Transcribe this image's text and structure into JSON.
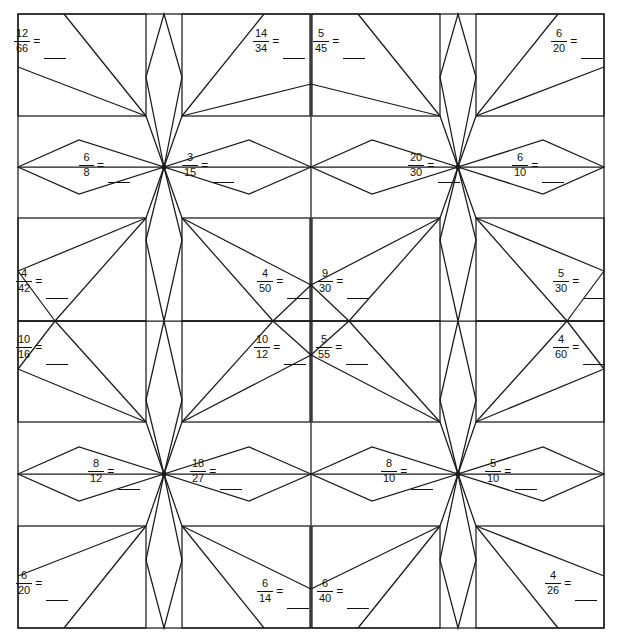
{
  "page": {
    "kind": "worksheet",
    "background_color": "#ffffff",
    "ink_color": "#111111",
    "width": 618,
    "height": 636,
    "equals_symbol": "=",
    "blank_symbol": "____"
  },
  "grid": {
    "rows": 6,
    "cols": 4,
    "left": 18,
    "top": 14,
    "right": 604,
    "bottom": 628,
    "row_edges": [
      14,
      116,
      218,
      320,
      422,
      524,
      628
    ],
    "col_edges": [
      18,
      164,
      310,
      458,
      604
    ]
  },
  "problems": [
    {
      "id": "p1",
      "row": 1,
      "col": 1,
      "numerator": "12",
      "denominator": "66",
      "x": 14,
      "y": 28,
      "style": "drop"
    },
    {
      "id": "p2",
      "row": 1,
      "col": 2,
      "numerator": "14",
      "denominator": "34",
      "x": 253,
      "y": 28,
      "style": "drop"
    },
    {
      "id": "p3",
      "row": 1,
      "col": 3,
      "numerator": "5",
      "denominator": "45",
      "x": 313,
      "y": 28,
      "style": "drop"
    },
    {
      "id": "p4",
      "row": 1,
      "col": 4,
      "numerator": "6",
      "denominator": "20",
      "x": 551,
      "y": 28,
      "style": "drop"
    },
    {
      "id": "p5",
      "row": 2,
      "col": 1,
      "numerator": "6",
      "denominator": "8",
      "x": 79,
      "y": 152,
      "style": "drop"
    },
    {
      "id": "p6",
      "row": 2,
      "col": 2,
      "numerator": "3",
      "denominator": "15",
      "x": 182,
      "y": 152,
      "style": "drop"
    },
    {
      "id": "p7",
      "row": 2,
      "col": 3,
      "numerator": "20",
      "denominator": "30",
      "x": 408,
      "y": 152,
      "style": "drop"
    },
    {
      "id": "p8",
      "row": 2,
      "col": 4,
      "numerator": "6",
      "denominator": "10",
      "x": 512,
      "y": 152,
      "style": "drop"
    },
    {
      "id": "p9",
      "row": 3,
      "col": 1,
      "numerator": "4",
      "denominator": "42",
      "x": 16,
      "y": 268,
      "style": "drop"
    },
    {
      "id": "p10",
      "row": 3,
      "col": 2,
      "numerator": "4",
      "denominator": "50",
      "x": 257,
      "y": 268,
      "style": "drop"
    },
    {
      "id": "p11",
      "row": 3,
      "col": 3,
      "numerator": "9",
      "denominator": "30",
      "x": 317,
      "y": 268,
      "style": "drop"
    },
    {
      "id": "p12",
      "row": 3,
      "col": 4,
      "numerator": "5",
      "denominator": "30",
      "x": 553,
      "y": 268,
      "style": "drop"
    },
    {
      "id": "p13",
      "row": 4,
      "col": 1,
      "numerator": "10",
      "denominator": "16",
      "x": 16,
      "y": 334,
      "style": "drop"
    },
    {
      "id": "p14",
      "row": 4,
      "col": 2,
      "numerator": "10",
      "denominator": "12",
      "x": 254,
      "y": 334,
      "style": "drop"
    },
    {
      "id": "p15",
      "row": 4,
      "col": 3,
      "numerator": "5",
      "denominator": "55",
      "x": 316,
      "y": 334,
      "style": "drop"
    },
    {
      "id": "p16",
      "row": 4,
      "col": 4,
      "numerator": "4",
      "denominator": "60",
      "x": 553,
      "y": 334,
      "style": "drop"
    },
    {
      "id": "p17",
      "row": 5,
      "col": 1,
      "numerator": "8",
      "denominator": "12",
      "x": 88,
      "y": 458,
      "style": "drop2"
    },
    {
      "id": "p18",
      "row": 5,
      "col": 2,
      "numerator": "18",
      "denominator": "27",
      "x": 190,
      "y": 458,
      "style": "drop2"
    },
    {
      "id": "p19",
      "row": 5,
      "col": 3,
      "numerator": "8",
      "denominator": "10",
      "x": 381,
      "y": 458,
      "style": "drop2"
    },
    {
      "id": "p20",
      "row": 5,
      "col": 4,
      "numerator": "5",
      "denominator": "10",
      "x": 485,
      "y": 458,
      "style": "drop2"
    },
    {
      "id": "p21",
      "row": 6,
      "col": 1,
      "numerator": "6",
      "denominator": "20",
      "x": 16,
      "y": 570,
      "style": "drop"
    },
    {
      "id": "p22",
      "row": 6,
      "col": 2,
      "numerator": "6",
      "denominator": "14",
      "x": 257,
      "y": 578,
      "style": "drop"
    },
    {
      "id": "p23",
      "row": 6,
      "col": 3,
      "numerator": "6",
      "denominator": "40",
      "x": 317,
      "y": 578,
      "style": "drop"
    },
    {
      "id": "p24",
      "row": 6,
      "col": 4,
      "numerator": "4",
      "denominator": "26",
      "x": 545,
      "y": 570,
      "style": "drop"
    }
  ]
}
